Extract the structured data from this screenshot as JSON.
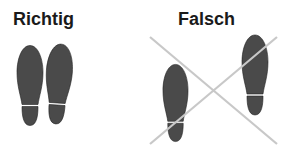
{
  "panels": {
    "correct": {
      "title": "Richtig"
    },
    "wrong": {
      "title": "Falsch"
    }
  },
  "colors": {
    "shoe_sole": "#4a4a4a",
    "cross": "#c8c8c8",
    "title_text": "#1a1a1a",
    "background": "#ffffff"
  }
}
